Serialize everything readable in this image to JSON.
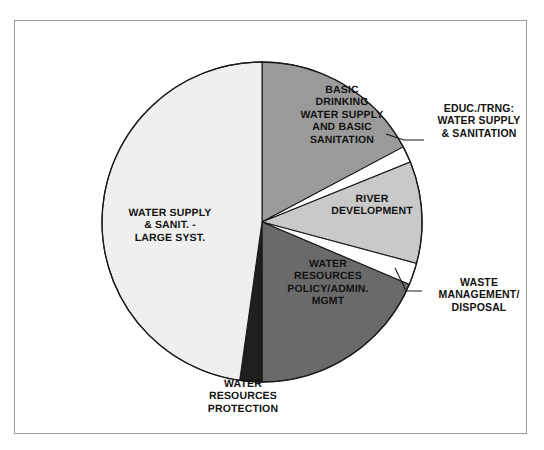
{
  "figure": {
    "background_color": "#ffffff",
    "frame_border_color": "#9b9b9b"
  },
  "chart_data": {
    "type": "pie",
    "title": "",
    "subtitle": "",
    "xlabel": "",
    "ylabel": "",
    "legend_position": "none",
    "grid": false,
    "labels_on_slices": true,
    "start_angle_deg": 0,
    "direction": "clockwise",
    "center": {
      "x": 262,
      "y": 222
    },
    "radius": 160,
    "categories": [
      "BASIC DRINKING WATER SUPPLY AND BASIC SANITATION",
      "EDUC./TRNG: WATER SUPPLY & SANITATION",
      "RIVER DEVELOPMENT",
      "WASTE MANAGEMENT/ DISPOSAL",
      "WATER RESOURCES POLICY/ADMIN. MGMT",
      "WATER RESOURCES PROTECTION",
      "WATER SUPPLY & SANIT. - LARGE SYST."
    ],
    "values": [
      17.2,
      1.7,
      10.3,
      2.2,
      18.6,
      2.2,
      47.8
    ],
    "slices": [
      {
        "name": "basic-drinking-water-supply-and-basic-sanitation",
        "label": "BASIC\nDRINKING\nWATER SUPPLY\nAND BASIC\nSANITATION",
        "value": 17.2,
        "start_deg": 0,
        "end_deg": 62,
        "color": "#9a9a9a",
        "label_placement": "inside"
      },
      {
        "name": "educ-trng-water-supply-and-sanitation",
        "label": "EDUC./TRNG:\nWATER SUPPLY\n& SANITATION",
        "value": 1.7,
        "start_deg": 62,
        "end_deg": 68,
        "color": "#ffffff",
        "label_placement": "callout"
      },
      {
        "name": "river-development",
        "label": "RIVER\nDEVELOPMENT",
        "value": 10.3,
        "start_deg": 68,
        "end_deg": 105,
        "color": "#c9c9c9",
        "label_placement": "inside"
      },
      {
        "name": "waste-management-disposal",
        "label": "WASTE\nMANAGEMENT/\nDISPOSAL",
        "value": 2.2,
        "start_deg": 105,
        "end_deg": 113,
        "color": "#ffffff",
        "label_placement": "callout"
      },
      {
        "name": "water-resources-policy-admin-mgmt",
        "label": "WATER\nRESOURCES\nPOLICY/ADMIN.\nMGMT",
        "value": 18.6,
        "start_deg": 113,
        "end_deg": 180,
        "color": "#6a6a6a",
        "label_placement": "inside"
      },
      {
        "name": "water-resources-protection",
        "label": "WATER\nRESOURCES\nPROTECTION",
        "value": 2.2,
        "start_deg": 180,
        "end_deg": 188,
        "color": "#1f1f1f",
        "label_placement": "outside-bottom"
      },
      {
        "name": "water-supply-sanit-large-syst",
        "label": "WATER SUPPLY\n& SANIT. -\nLARGE SYST.",
        "value": 47.8,
        "start_deg": 188,
        "end_deg": 360,
        "color": "#efefef",
        "label_placement": "inside"
      }
    ],
    "slice_outline_color": "#1a1a1a",
    "label_text_color": "#121212"
  }
}
